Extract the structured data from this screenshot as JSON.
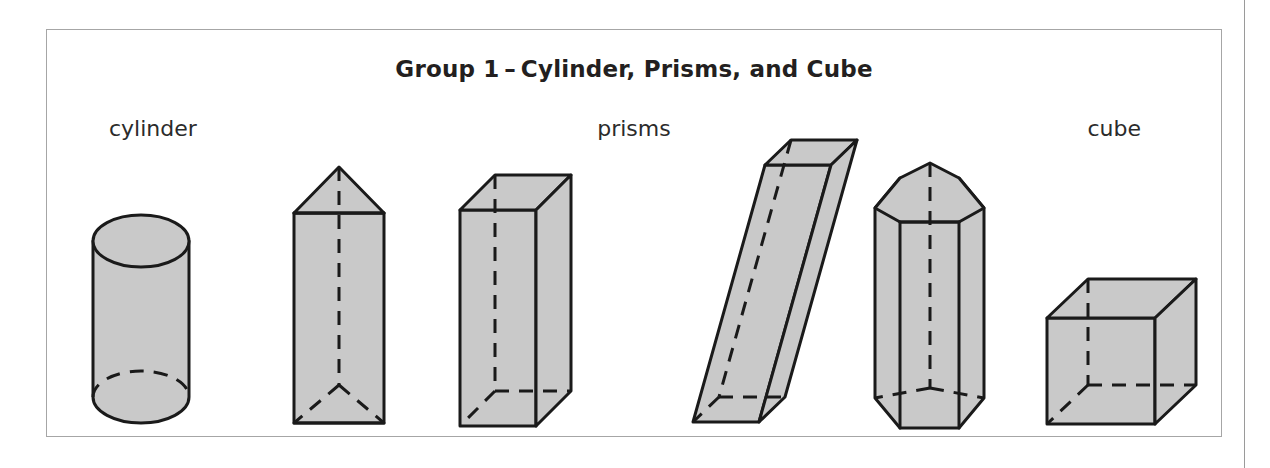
{
  "figure": {
    "title": "Group 1 – Cylinder, Prisms, and Cube",
    "labels": {
      "cylinder": "cylinder",
      "prisms": "prisms",
      "cube": "cube"
    },
    "colors": {
      "shape_fill": "#c9c9c9",
      "shape_stroke": "#1a1a1a",
      "frame_border": "#a6a6a6",
      "page_rule": "#9a9a9a",
      "background": "#ffffff",
      "title_text": "#231f20",
      "label_text": "#2b2b2b"
    },
    "shapes": [
      {
        "name": "cylinder",
        "group": "cylinder",
        "kind": "cylinder",
        "hidden_edges": "dashed"
      },
      {
        "name": "triangular-prism",
        "group": "prisms",
        "kind": "triangular prism",
        "hidden_edges": "dashed"
      },
      {
        "name": "rectangular-prism",
        "group": "prisms",
        "kind": "rectangular prism",
        "hidden_edges": "dashed"
      },
      {
        "name": "oblique-prism",
        "group": "prisms",
        "kind": "oblique rectangular prism",
        "hidden_edges": "dashed"
      },
      {
        "name": "pentagonal-prism",
        "group": "prisms",
        "kind": "pentagonal prism",
        "hidden_edges": "dashed"
      },
      {
        "name": "cube",
        "group": "cube",
        "kind": "cube",
        "hidden_edges": "dashed"
      }
    ]
  }
}
